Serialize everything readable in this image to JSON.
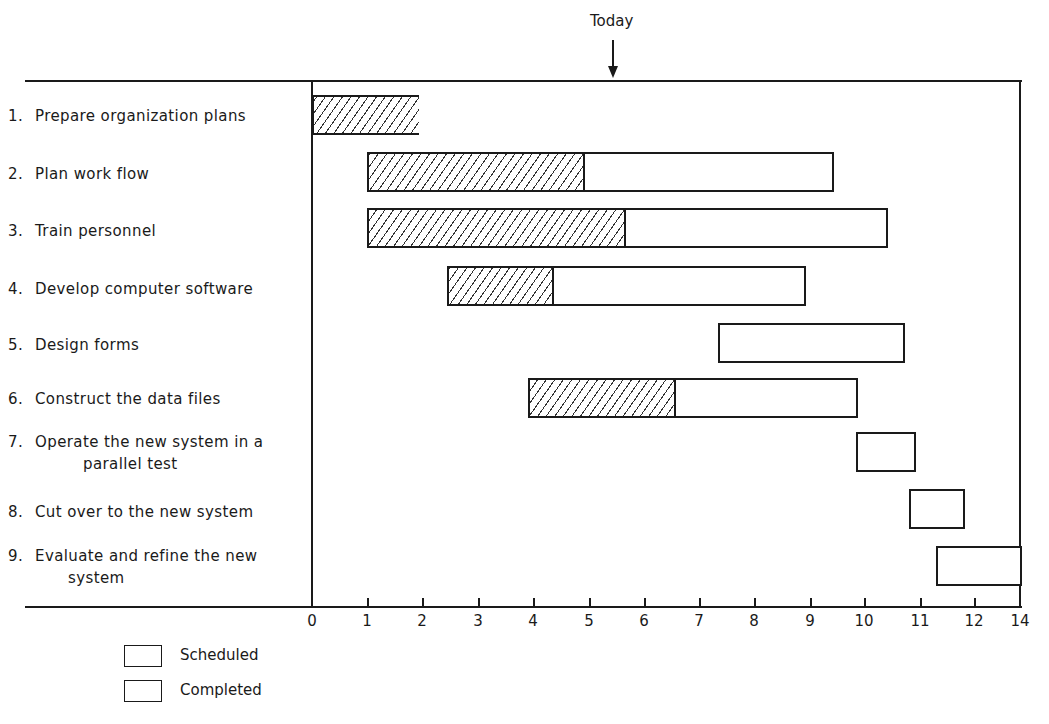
{
  "chart_data": {
    "type": "gantt",
    "title": "",
    "annotation": {
      "label": "Today",
      "x": 5.45
    },
    "xlabel": "",
    "ylabel": "",
    "x_ticks": [
      "0",
      "1",
      "2",
      "3",
      "4",
      "5",
      "6",
      "7",
      "8",
      "9",
      "10",
      "11",
      "12",
      "14"
    ],
    "xlim": [
      0,
      14
    ],
    "grid": false,
    "legend": {
      "position": "bottom-left",
      "entries": [
        {
          "name": "Scheduled",
          "style": "empty"
        },
        {
          "name": "Completed",
          "style": "hatched"
        }
      ]
    },
    "tasks": [
      {
        "id": 1,
        "label": "Prepare organization plans",
        "start": 0.0,
        "completed_end": 1.9,
        "end": 1.9
      },
      {
        "id": 2,
        "label": "Plan work flow",
        "start": 1.0,
        "completed_end": 4.85,
        "end": 9.4
      },
      {
        "id": 3,
        "label": "Train personnel",
        "start": 1.0,
        "completed_end": 5.6,
        "end": 10.4
      },
      {
        "id": 4,
        "label": "Develop computer software",
        "start": 2.45,
        "completed_end": 4.3,
        "end": 8.9
      },
      {
        "id": 5,
        "label": "Design forms",
        "start": 7.35,
        "completed_end": null,
        "end": 10.7
      },
      {
        "id": 6,
        "label": "Construct the data files",
        "start": 3.9,
        "completed_end": 6.5,
        "end": 9.85
      },
      {
        "id": 7,
        "label": "Operate the new system in a parallel test",
        "start": 9.85,
        "completed_end": null,
        "end": 10.9
      },
      {
        "id": 8,
        "label": "Cut over to the new system",
        "start": 10.8,
        "completed_end": null,
        "end": 11.8
      },
      {
        "id": 9,
        "label": "Evaluate and refine the new system",
        "start": 11.3,
        "completed_end": null,
        "end": 14
      }
    ]
  },
  "labels": {
    "today": "Today",
    "tasks": [
      {
        "num": "1.",
        "line1": "Prepare organization plans",
        "line2": ""
      },
      {
        "num": "2.",
        "line1": "Plan work flow",
        "line2": ""
      },
      {
        "num": "3.",
        "line1": "Train personnel",
        "line2": ""
      },
      {
        "num": "4.",
        "line1": "Develop computer software",
        "line2": ""
      },
      {
        "num": "5.",
        "line1": "Design forms",
        "line2": ""
      },
      {
        "num": "6.",
        "line1": "Construct the data files",
        "line2": ""
      },
      {
        "num": "7.",
        "line1": "Operate the new system in a",
        "line2": "parallel test"
      },
      {
        "num": "8.",
        "line1": "Cut over to the new system",
        "line2": ""
      },
      {
        "num": "9.",
        "line1": "Evaluate and refine the new",
        "line2": "system"
      }
    ],
    "ticks": [
      "0",
      "1",
      "2",
      "3",
      "4",
      "5",
      "6",
      "7",
      "8",
      "9",
      "10",
      "11",
      "12",
      "14"
    ],
    "legend": {
      "scheduled": "Scheduled",
      "completed": "Completed"
    }
  }
}
